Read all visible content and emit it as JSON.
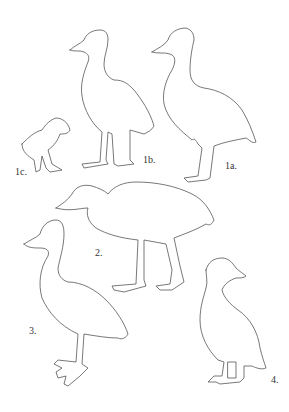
{
  "figure": {
    "background": "#ffffff",
    "stroke_color": "#555555",
    "birds": [
      {
        "id": "1a",
        "label": "1a.",
        "description": "adult, long-necked standing bird facing left"
      },
      {
        "id": "1b",
        "label": "1b.",
        "description": "juvenile standing bird facing left"
      },
      {
        "id": "1c",
        "label": "1c.",
        "description": "small chick facing right"
      },
      {
        "id": "2",
        "label": "2.",
        "description": "crouching bird walking, facing left"
      },
      {
        "id": "3",
        "label": "3.",
        "description": "large standing bird facing left, webbed feet"
      },
      {
        "id": "4",
        "label": "4.",
        "description": "duck facing right"
      }
    ]
  }
}
